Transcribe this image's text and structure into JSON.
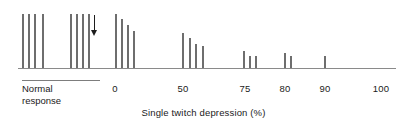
{
  "chart_data": {
    "type": "bar",
    "title": "",
    "xlabel": "Single twitch depression (%)",
    "ylabel": "",
    "grid": false,
    "legend": null,
    "xlim": [
      -40,
      105
    ],
    "ylim": [
      0,
      100
    ],
    "axis_tick_labels": [
      "0",
      "50",
      "75",
      "80",
      "90",
      "100"
    ],
    "axis_tick_values": [
      0,
      50,
      75,
      80,
      90,
      100
    ],
    "normal_response_label": "Normal response",
    "normal_response_line1": "Normal",
    "normal_response_line2": "response",
    "arrow_annotation": "down-arrow marker",
    "groups": [
      {
        "name": "normal-response-group-1",
        "values": [
          100,
          100,
          100,
          100
        ]
      },
      {
        "name": "normal-response-group-2",
        "values": [
          100,
          100,
          100,
          100
        ]
      },
      {
        "name": "group-at-0",
        "values": [
          100,
          90,
          79,
          69
        ]
      },
      {
        "name": "group-at-50",
        "values": [
          65,
          56,
          45,
          40
        ]
      },
      {
        "name": "group-at-75",
        "values": [
          31,
          22,
          22
        ]
      },
      {
        "name": "group-at-80",
        "values": [
          27,
          22
        ]
      },
      {
        "name": "group-at-90",
        "values": [
          22
        ]
      }
    ],
    "bars": [
      {
        "x": 22,
        "height": 100,
        "group": "normal-response-group-1"
      },
      {
        "x": 28,
        "height": 100,
        "group": "normal-response-group-1"
      },
      {
        "x": 34,
        "height": 100,
        "group": "normal-response-group-1"
      },
      {
        "x": 42,
        "height": 100,
        "group": "normal-response-group-1"
      },
      {
        "x": 70,
        "height": 100,
        "group": "normal-response-group-2"
      },
      {
        "x": 76,
        "height": 100,
        "group": "normal-response-group-2"
      },
      {
        "x": 82,
        "height": 100,
        "group": "normal-response-group-2"
      },
      {
        "x": 88,
        "height": 100,
        "group": "normal-response-group-2"
      },
      {
        "x": 115,
        "height": 100,
        "group": "group-at-0"
      },
      {
        "x": 121,
        "height": 90,
        "group": "group-at-0"
      },
      {
        "x": 127,
        "height": 79,
        "group": "group-at-0"
      },
      {
        "x": 133,
        "height": 69,
        "group": "group-at-0"
      },
      {
        "x": 182,
        "height": 65,
        "group": "group-at-50"
      },
      {
        "x": 189,
        "height": 56,
        "group": "group-at-50"
      },
      {
        "x": 195,
        "height": 45,
        "group": "group-at-50"
      },
      {
        "x": 202,
        "height": 40,
        "group": "group-at-50"
      },
      {
        "x": 243,
        "height": 31,
        "group": "group-at-75"
      },
      {
        "x": 249,
        "height": 22,
        "group": "group-at-75"
      },
      {
        "x": 255,
        "height": 22,
        "group": "group-at-75"
      },
      {
        "x": 284,
        "height": 27,
        "group": "group-at-80"
      },
      {
        "x": 290,
        "height": 22,
        "group": "group-at-80"
      },
      {
        "x": 324,
        "height": 22,
        "group": "group-at-90"
      }
    ],
    "tick_positions_px": [
      115,
      183,
      245,
      285,
      325,
      381
    ],
    "baseline": {
      "x_start": 18,
      "x_end": 396,
      "y": 68
    },
    "arrow": {
      "x": 94,
      "y_top": 15,
      "y_bottom": 36
    },
    "colors": {
      "bar": "#6e6e6e",
      "axis": "#8a8a8a",
      "text": "#1a1a1a",
      "arrow": "#1d1d1d",
      "background": "#ffffff"
    }
  }
}
